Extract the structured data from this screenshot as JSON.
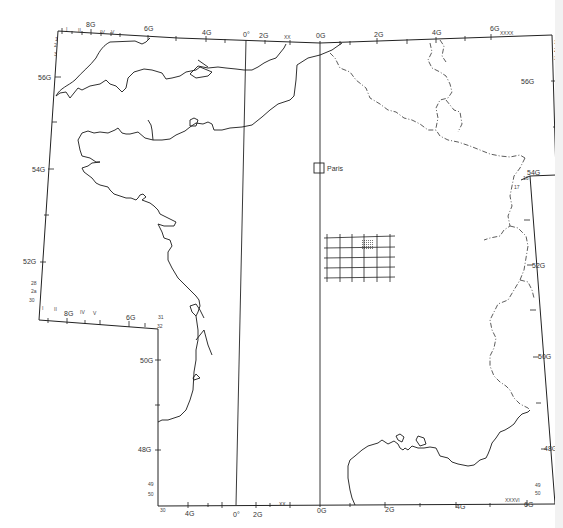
{
  "map": {
    "title": "",
    "city_label": "Paris",
    "colors": {
      "line": "#1a1a1a",
      "background": "#ffffff",
      "hatch": "#888888"
    },
    "top_axis": {
      "labels": [
        {
          "text": "8G",
          "x": 90,
          "y": 27
        },
        {
          "text": "6G",
          "x": 148,
          "y": 31
        },
        {
          "text": "4G",
          "x": 206,
          "y": 35
        },
        {
          "text": "0°",
          "x": 245,
          "y": 37
        },
        {
          "text": "2G",
          "x": 263,
          "y": 38
        },
        {
          "text": "XX",
          "x": 285,
          "y": 39
        },
        {
          "text": "0G",
          "x": 318,
          "y": 39
        },
        {
          "text": "2G",
          "x": 377,
          "y": 38
        },
        {
          "text": "4G",
          "x": 436,
          "y": 37
        },
        {
          "text": "6G",
          "x": 491,
          "y": 33
        },
        {
          "text": "XXXX",
          "x": 508,
          "y": 35
        }
      ],
      "small_labels": [
        "I",
        "II",
        "IV",
        "V"
      ]
    },
    "bottom_axis": {
      "labels": [
        {
          "text": "30",
          "x": 159,
          "y": 505
        },
        {
          "text": "4G",
          "x": 186,
          "y": 507
        },
        {
          "text": "0°",
          "x": 234,
          "y": 510
        },
        {
          "text": "2G",
          "x": 254,
          "y": 510
        },
        {
          "text": "XX",
          "x": 280,
          "y": 506
        },
        {
          "text": "0G",
          "x": 318,
          "y": 512
        },
        {
          "text": "2G",
          "x": 385,
          "y": 511
        },
        {
          "text": "4G",
          "x": 456,
          "y": 508
        },
        {
          "text": "XXXVI",
          "x": 505,
          "y": 501
        },
        {
          "text": "6G",
          "x": 527,
          "y": 504
        }
      ]
    },
    "left_axis": {
      "labels": [
        {
          "text": "56G",
          "x": 36,
          "y": 77
        },
        {
          "text": "54G",
          "x": 32,
          "y": 169
        },
        {
          "text": "52G",
          "x": 24,
          "y": 262
        },
        {
          "text": "50G",
          "x": 140,
          "y": 362
        },
        {
          "text": "48G",
          "x": 140,
          "y": 452
        }
      ],
      "small_labels": [
        "1",
        "2",
        "3",
        "28",
        "2a",
        "30",
        "31",
        "32",
        "49",
        "50"
      ]
    },
    "inset_axis": {
      "labels": [
        {
          "text": "8G",
          "x": 66,
          "y": 318
        },
        {
          "text": "6G",
          "x": 128,
          "y": 322
        }
      ],
      "small_labels": [
        "I",
        "II",
        "IV",
        "V"
      ]
    },
    "right_axis": {
      "labels": [
        {
          "text": "56G",
          "x": 522,
          "y": 84
        },
        {
          "text": "54G",
          "x": 526,
          "y": 176
        },
        {
          "text": "52G",
          "x": 531,
          "y": 266
        },
        {
          "text": "50G",
          "x": 537,
          "y": 357
        },
        {
          "text": "48G",
          "x": 544,
          "y": 449
        }
      ],
      "small_labels": [
        "1",
        "2",
        "3",
        "16",
        "17",
        "49",
        "50"
      ]
    },
    "grid_overlay": {
      "rows": 4,
      "cols": 6,
      "highlighted_cell": {
        "row": 1,
        "col": 3
      }
    }
  }
}
